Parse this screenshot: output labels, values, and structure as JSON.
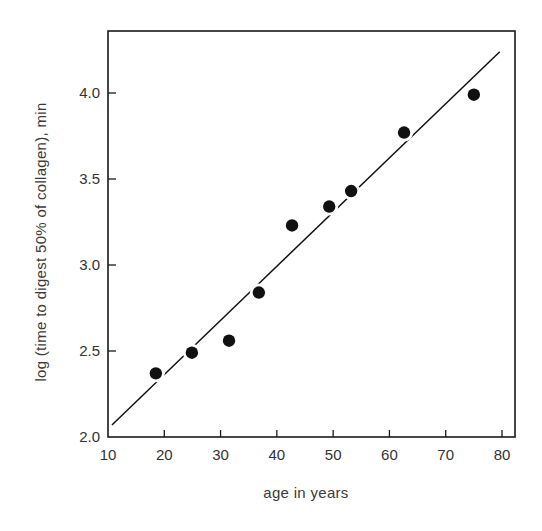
{
  "chart_data": {
    "type": "scatter",
    "title": "",
    "xlabel": "age in years",
    "ylabel": "log (time to digest 50% of collagen), min",
    "xlim": [
      10,
      82
    ],
    "ylim": [
      2.0,
      4.27
    ],
    "x_ticks": [
      10,
      20,
      30,
      40,
      50,
      60,
      70,
      80
    ],
    "y_ticks": [
      2.0,
      2.5,
      3.0,
      3.5,
      4.0
    ],
    "x_tick_labels": [
      "10",
      "20",
      "30",
      "40",
      "50",
      "60",
      "70",
      "80"
    ],
    "y_tick_labels": [
      "2.0",
      "2.5",
      "3.0",
      "3.5",
      "4.0"
    ],
    "grid": false,
    "legend": null,
    "series": [
      {
        "name": "data points",
        "kind": "scatter",
        "marker": "filled-circle",
        "color": "#111111",
        "x": [
          18.5,
          24.9,
          31.5,
          36.8,
          42.7,
          49.3,
          53.2,
          62.6,
          75.0
        ],
        "y": [
          2.37,
          2.49,
          2.56,
          2.84,
          3.23,
          3.34,
          3.43,
          3.77,
          3.99
        ]
      },
      {
        "name": "regression line",
        "kind": "line",
        "color": "#111111",
        "x": [
          10.7,
          79.6
        ],
        "y": [
          2.07,
          4.24
        ]
      }
    ]
  },
  "labels": {
    "xlabel": "age in years",
    "ylabel": "log (time to digest 50% of collagen), min"
  }
}
